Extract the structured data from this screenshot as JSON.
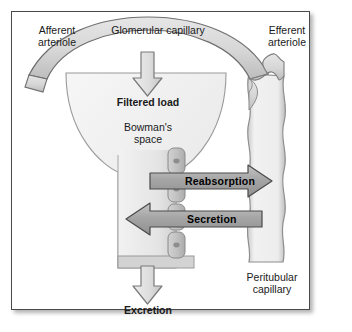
{
  "figure": {
    "border_color": "#4a4a4a",
    "background": "#ffffff"
  },
  "palette": {
    "vessel_fill": "#d5d5d5",
    "vessel_stroke": "#6e6e6e",
    "bowman_fill": "#ededed",
    "bowman_stroke": "#8a8a8a",
    "tubule_fill": "#e4e4e4",
    "cell_fill": "#c2c2c2",
    "cell_stroke": "#8a8a8a",
    "nucleus_fill": "#8d8d8d",
    "band_arrow_fill": "#a8a8a8",
    "band_arrow_stroke": "#4a4a4a",
    "open_arrow_fill": "#d9d9d9",
    "open_arrow_stroke": "#7a7a7a",
    "text_color": "#1a1a1a"
  },
  "labels": {
    "afferent_arteriole": "Afferent\narteriole",
    "glomerular_capillary": "Glomerular capillary",
    "efferent_arteriole": "Efferent\narteriole",
    "filtered_load": "Filtered load",
    "bowmans_space": "Bowman's\nspace",
    "reabsorption": "Reabsorption",
    "secretion": "Secretion",
    "excretion": "Excretion",
    "peritubular_capillary": "Peritubular\ncapillary"
  },
  "flows": [
    {
      "name": "filtration",
      "label": "Filtered load",
      "direction": "down",
      "style": "open-outline-arrow",
      "from": "glomerular capillary",
      "to": "Bowman's space"
    },
    {
      "name": "reabsorption",
      "label": "Reabsorption",
      "direction": "right",
      "style": "solid-band-arrow",
      "from": "tubule lumen",
      "to": "peritubular capillary"
    },
    {
      "name": "secretion",
      "label": "Secretion",
      "direction": "left",
      "style": "solid-band-arrow",
      "from": "peritubular capillary",
      "to": "tubule lumen"
    },
    {
      "name": "excretion",
      "label": "Excretion",
      "direction": "down",
      "style": "open-outline-arrow",
      "from": "tubule",
      "to": "urine"
    }
  ],
  "structures": [
    {
      "name": "afferent-arteriole",
      "label": "Afferent arteriole"
    },
    {
      "name": "glomerular-capillary",
      "label": "Glomerular capillary"
    },
    {
      "name": "efferent-arteriole",
      "label": "Efferent arteriole"
    },
    {
      "name": "bowmans-capsule",
      "label": "Bowman's space"
    },
    {
      "name": "renal-tubule",
      "label": "Renal tubule"
    },
    {
      "name": "tubular-epithelial-cells",
      "label": "Tubular epithelial cells",
      "count": 4
    },
    {
      "name": "peritubular-capillary",
      "label": "Peritubular capillary"
    }
  ]
}
